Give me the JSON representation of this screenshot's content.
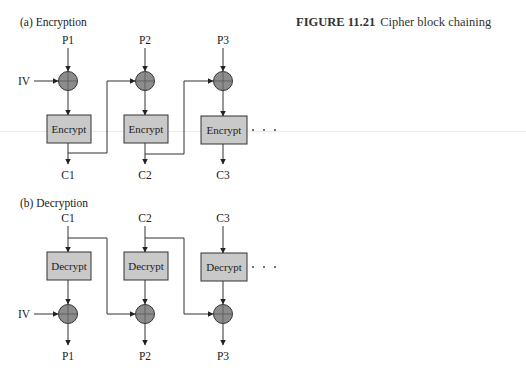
{
  "figure": {
    "number": "FIGURE 11.21",
    "title": "Cipher block chaining"
  },
  "encryption": {
    "heading": "(a) Encryption",
    "iv_label": "IV",
    "inputs": [
      "P1",
      "P2",
      "P3"
    ],
    "outputs": [
      "C1",
      "C2",
      "C3"
    ],
    "block_label": "Encrypt",
    "ellipsis": "· · ·"
  },
  "decryption": {
    "heading": "(b) Decryption",
    "iv_label": "IV",
    "inputs": [
      "C1",
      "C2",
      "C3"
    ],
    "outputs": [
      "P1",
      "P2",
      "P3"
    ],
    "block_label": "Decrypt",
    "ellipsis": "· · ·"
  },
  "colors": {
    "block_fill": "#c9c9c9",
    "xor_fill": "#8c8c8c",
    "line": "#333333"
  }
}
